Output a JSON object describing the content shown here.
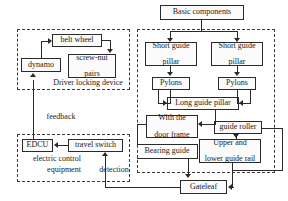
{
  "diagram": {
    "type": "block-diagram",
    "title_box": {
      "label": "Basic components"
    },
    "groups": [
      {
        "id": "driver-locking-device",
        "label": "Driver locking device"
      },
      {
        "id": "electric-control-equipment",
        "label_line1": "electric control",
        "label_line2": "equipment"
      },
      {
        "id": "basic-components-group",
        "label": ""
      }
    ],
    "nodes": [
      {
        "id": "basic-components",
        "label": "Basic components"
      },
      {
        "id": "belt-wheel",
        "label": "belt wheel"
      },
      {
        "id": "dynamo",
        "label": "dynamo"
      },
      {
        "id": "screw-nut-pairs",
        "line1": "screw-nut",
        "line2": "pairs"
      },
      {
        "id": "edcu",
        "label": "EDCU"
      },
      {
        "id": "travel-switch",
        "label": "travel switch"
      },
      {
        "id": "short-guide-pillar-left",
        "line1": "Short guide",
        "line2": "pillar"
      },
      {
        "id": "short-guide-pillar-right",
        "line1": "Short guide",
        "line2": "pillar"
      },
      {
        "id": "pylons-left",
        "label": "Pylons"
      },
      {
        "id": "pylons-right",
        "label": "Pylons"
      },
      {
        "id": "long-guide-pillar",
        "label": "Long guide pillar"
      },
      {
        "id": "with-the-door-frame",
        "line1": "With the",
        "line2": "door frame"
      },
      {
        "id": "guide-roller",
        "label": "guide roller"
      },
      {
        "id": "upper-and-lower-guide-rail",
        "line1": "Upper and",
        "line2": "lower guide rail"
      },
      {
        "id": "gateleaf",
        "label": "Gateleaf"
      }
    ],
    "edge_labels": [
      {
        "id": "feedback",
        "label": "feedback"
      },
      {
        "id": "detection",
        "label": "detection"
      },
      {
        "id": "bearing-guide",
        "label": "Bearing guide"
      }
    ],
    "colors": {
      "line": "#2a2a2a",
      "dashed_border": "#3a3a3a",
      "box_fill": "#fbfbfb",
      "background": "#ffffff",
      "text": "#1a1a1a"
    }
  }
}
